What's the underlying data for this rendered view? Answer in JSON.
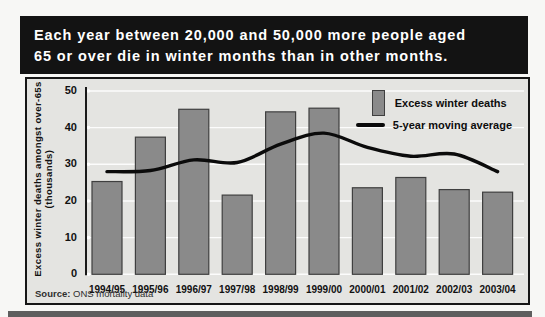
{
  "page": {
    "title_line1": "Each year between 20,000 and 50,000 more people aged",
    "title_line2": "65 or over die in winter months than in other months.",
    "source_label": "Source:",
    "source_text": " ONS mortality data"
  },
  "colors": {
    "title_band_bg": "#131313",
    "title_text": "#ffffff",
    "chart_bg": "#e4e4e1",
    "chart_border": "#161616",
    "bar_fill": "#8a8a8a",
    "bar_border": "#3f3f3f",
    "line_color": "#0b0b0b",
    "grid_color": "#ffffff",
    "axis_color": "#1a1a1a"
  },
  "chart_data": {
    "type": "bar",
    "title": "Each year between 20,000 and 50,000 more people aged 65 or over die in winter months than in other months.",
    "categories": [
      "1994/95",
      "1995/96",
      "1996/97",
      "1997/98",
      "1998/99",
      "1999/00",
      "2000/01",
      "2001/02",
      "2002/03",
      "2003/04"
    ],
    "series": [
      {
        "name": "Excess winter deaths",
        "type": "bar",
        "values": [
          25.3,
          37.4,
          45.0,
          21.6,
          44.3,
          45.3,
          23.6,
          26.4,
          23.1,
          22.4
        ],
        "color": "#8a8a8a"
      },
      {
        "name": "5-year moving average",
        "type": "line",
        "values": [
          28.0,
          28.3,
          31.2,
          30.5,
          35.5,
          38.5,
          34.6,
          32.2,
          32.8,
          28.0
        ],
        "color": "#0b0b0b"
      }
    ],
    "xlabel": "",
    "ylabel_line1": "Excess winter deaths amongst over-65s",
    "ylabel_line2": "(thousands)",
    "yticks": [
      0,
      10,
      20,
      30,
      40,
      50
    ],
    "ylim": [
      0,
      52
    ],
    "grid": "horizontal-white",
    "legend_position": "top-right",
    "source": "Source: ONS mortality data"
  }
}
